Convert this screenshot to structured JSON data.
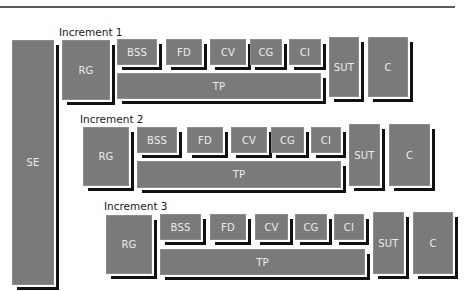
{
  "diagram": {
    "se_label": "SE",
    "increments": [
      {
        "title": "Increment 1",
        "rg": "RG",
        "phases": [
          "BSS",
          "FD",
          "CV",
          "CG",
          "CI"
        ],
        "tp": "TP",
        "sut": "SUT",
        "c": "C"
      },
      {
        "title": "Increment 2",
        "rg": "RG",
        "phases": [
          "BSS",
          "FD",
          "CV",
          "CG",
          "CI"
        ],
        "tp": "TP",
        "sut": "SUT",
        "c": "C"
      },
      {
        "title": "Increment 3",
        "rg": "RG",
        "phases": [
          "BSS",
          "FD",
          "CV",
          "CG",
          "CI"
        ],
        "tp": "TP",
        "sut": "SUT",
        "c": "C"
      }
    ]
  }
}
